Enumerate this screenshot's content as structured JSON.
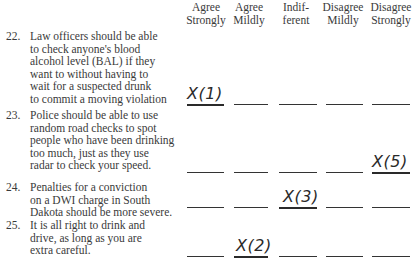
{
  "scale": {
    "columns": [
      {
        "line1": "Agree",
        "line2": "Strongly"
      },
      {
        "line1": "Agree",
        "line2": "Mildly"
      },
      {
        "line1": "Indif-",
        "line2": "ferent"
      },
      {
        "line1": "Disagree",
        "line2": "Mildly"
      },
      {
        "line1": "Disagree",
        "line2": "Strongly"
      }
    ]
  },
  "questions": [
    {
      "number": "22.",
      "lines": [
        "Law officers should be able",
        "to check anyone's blood",
        "alcohol level (BAL) if they",
        "want to without having to",
        "wait for a suspected drunk",
        "to commit a moving violation"
      ],
      "selected_column": 1,
      "mark": "X(1)"
    },
    {
      "number": "23.",
      "lines": [
        "Police should be able to use",
        "random road checks to spot",
        "people who have been drinking",
        "too much, just as they use",
        "radar to check your speed."
      ],
      "selected_column": 5,
      "mark": "X(5)"
    },
    {
      "number": "24.",
      "lines": [
        "Penalties for a conviction",
        "on a DWI charge in South",
        "Dakota should be more severe."
      ],
      "selected_column": 3,
      "mark": "X(3)"
    },
    {
      "number": "25.",
      "lines": [
        "It is all right to drink and",
        "drive, as long as you are",
        "extra careful."
      ],
      "selected_column": 2,
      "mark": "X(2)"
    }
  ]
}
